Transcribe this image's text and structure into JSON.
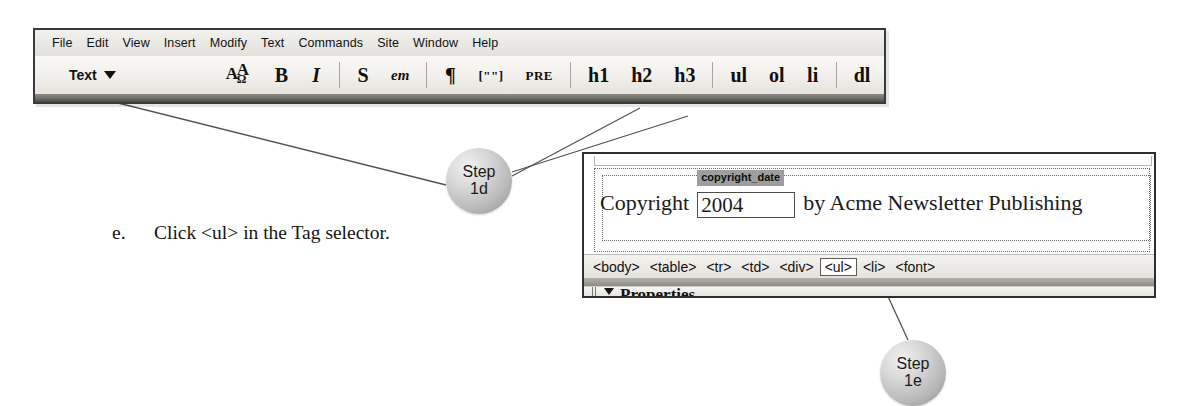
{
  "toolbar": {
    "menu_items": [
      "File",
      "Edit",
      "View",
      "Insert",
      "Modify",
      "Text",
      "Commands",
      "Site",
      "Window",
      "Help"
    ],
    "dropdown_label": "Text",
    "dropdown_icon": "chevron-down-icon",
    "buttons": [
      {
        "id": "special-characters",
        "label": "A",
        "label2": "A",
        "label3": "Ω",
        "kind": "specialchar"
      },
      {
        "id": "bold",
        "label": "B",
        "kind": "bold"
      },
      {
        "id": "italic",
        "label": "I",
        "kind": "italic"
      },
      {
        "id": "strong",
        "label": "S",
        "kind": "bold"
      },
      {
        "id": "emphasis",
        "label": "em",
        "kind": "italic-small"
      },
      {
        "id": "paragraph",
        "label": "¶",
        "kind": "bold"
      },
      {
        "id": "blockquote",
        "label": "[\"\"]",
        "kind": "mono"
      },
      {
        "id": "preformatted",
        "label": "PRE",
        "kind": "mono"
      },
      {
        "id": "heading-1",
        "label": "h1",
        "kind": "bold"
      },
      {
        "id": "heading-2",
        "label": "h2",
        "kind": "bold"
      },
      {
        "id": "heading-3",
        "label": "h3",
        "kind": "bold"
      },
      {
        "id": "unordered-list",
        "label": "ul",
        "kind": "bold"
      },
      {
        "id": "ordered-list",
        "label": "ol",
        "kind": "bold"
      },
      {
        "id": "list-item",
        "label": "li",
        "kind": "bold"
      },
      {
        "id": "definition-list",
        "label": "dl",
        "kind": "bold"
      }
    ]
  },
  "callouts": {
    "step_1d": {
      "line1": "Step",
      "line2": "1d"
    },
    "step_1e": {
      "line1": "Step",
      "line2": "1e"
    }
  },
  "instruction": {
    "marker": "e.",
    "text": "Click <ul> in the Tag selector."
  },
  "document_window": {
    "copyright_prefix": "Copyright",
    "field": {
      "name_label": "copyright_date",
      "value": "2004"
    },
    "copyright_suffix": "by Acme Newsletter Publishing",
    "tag_selector": [
      {
        "label": "<body>",
        "selected": false
      },
      {
        "label": "<table>",
        "selected": false
      },
      {
        "label": "<tr>",
        "selected": false
      },
      {
        "label": "<td>",
        "selected": false
      },
      {
        "label": "<div>",
        "selected": false
      },
      {
        "label": "<ul>",
        "selected": true
      },
      {
        "label": "<li>",
        "selected": false
      },
      {
        "label": "<font>",
        "selected": false
      }
    ],
    "properties_panel": {
      "label": "Properties",
      "caret_icon": "triangle-down-icon",
      "grip_icon": "drag-grip-icon"
    }
  },
  "colors": {
    "page_background": "#ffffff",
    "panel_border": "#2f2f2f",
    "toolbar_face": "#efedE8",
    "bubble_fill": "#b9b9b9",
    "field_label_bg": "#9e9e9e",
    "leader_line": "#55534f"
  }
}
